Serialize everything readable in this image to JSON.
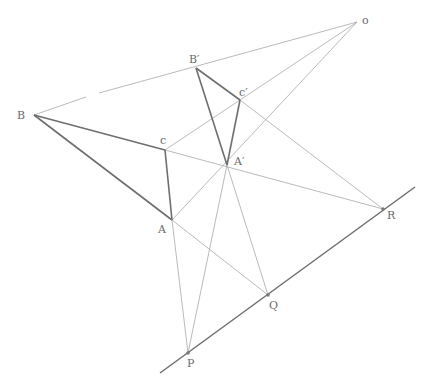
{
  "diagram": {
    "colors": {
      "background": "#ffffff",
      "thin_line": "#a8a8a8",
      "thick_line": "#6e6e6e",
      "label": "#6a6a6a"
    },
    "points": {
      "O": {
        "label": "o",
        "x": 357,
        "y": 22
      },
      "B": {
        "label": "B",
        "x": 34,
        "y": 115
      },
      "C": {
        "label": "c",
        "x": 165,
        "y": 150
      },
      "A": {
        "label": "A",
        "x": 172,
        "y": 220
      },
      "B2": {
        "label": "B′",
        "x": 196,
        "y": 68
      },
      "C2": {
        "label": "c′",
        "x": 240,
        "y": 100
      },
      "A2": {
        "label": "A′",
        "x": 227,
        "y": 165
      },
      "P": {
        "label": "P",
        "x": 188,
        "y": 353
      },
      "Q": {
        "label": "Q",
        "x": 268,
        "y": 295
      },
      "R": {
        "label": "R",
        "x": 383,
        "y": 209
      }
    },
    "labels": {
      "O": "o",
      "B": "B",
      "C": "c",
      "A": "A",
      "B2": "B′",
      "C2": "c′",
      "A2": "A′",
      "P": "P",
      "Q": "Q",
      "R": "R"
    }
  }
}
